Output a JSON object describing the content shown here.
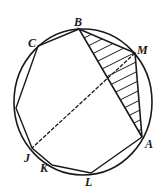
{
  "figure": {
    "circle": {
      "cx": 83,
      "cy": 102,
      "rx": 69,
      "ry": 73
    },
    "points": {
      "B": {
        "x": 79,
        "y": 29,
        "label": "B"
      },
      "M": {
        "x": 135,
        "y": 53,
        "label": "M"
      },
      "A": {
        "x": 142,
        "y": 137,
        "label": "A"
      },
      "L": {
        "x": 91,
        "y": 173,
        "label": "L"
      },
      "K": {
        "x": 52,
        "y": 165,
        "label": "K"
      },
      "J": {
        "x": 32,
        "y": 148,
        "label": "J"
      },
      "P": {
        "x": 16,
        "y": 108,
        "label": ""
      },
      "C": {
        "x": 38,
        "y": 46,
        "label": "C"
      }
    },
    "labels": {
      "B": "B",
      "M": "M",
      "A": "A",
      "L": "L",
      "K": "K",
      "J": "J",
      "C": "C"
    },
    "hatched_region": "triangle BMA",
    "dashed_segment": "M-J"
  }
}
